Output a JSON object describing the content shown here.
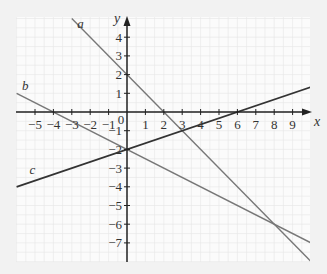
{
  "chart_data": {
    "type": "line",
    "title": "",
    "xlabel": "x",
    "ylabel": "y",
    "xlim": [
      -6,
      10
    ],
    "ylim": [
      -8,
      5
    ],
    "grid": true,
    "legend": "inline labels",
    "x_ticks": [
      -5,
      -4,
      -3,
      -2,
      -1,
      0,
      1,
      2,
      3,
      4,
      5,
      6,
      7,
      8,
      9
    ],
    "y_ticks": [
      4,
      3,
      2,
      1,
      -1,
      -2,
      -3,
      -4,
      -5,
      -6,
      -7
    ],
    "origin_label": "0",
    "series": [
      {
        "name": "a",
        "equation": "y = -x + 2",
        "x": [
          -3,
          10
        ],
        "y": [
          5,
          -8
        ],
        "color": "#777777"
      },
      {
        "name": "b",
        "equation": "y = -x/2 - 2",
        "x": [
          -6,
          10
        ],
        "y": [
          1,
          -7
        ],
        "color": "#777777"
      },
      {
        "name": "c",
        "equation": "y = x/3 - 2",
        "x": [
          -6,
          10
        ],
        "y": [
          -4,
          1.333
        ],
        "color": "#333333"
      }
    ],
    "annotations": [
      {
        "text": "a",
        "x": -2.7,
        "y": 4.5
      },
      {
        "text": "b",
        "x": -5.7,
        "y": 1.2
      },
      {
        "text": "c",
        "x": -5.3,
        "y": -3.3
      }
    ]
  },
  "colors": {
    "background": "#f2f2f2",
    "plot_bg": "#fbfbfb",
    "grid": "#e6e6e6",
    "axis": "#222222"
  }
}
